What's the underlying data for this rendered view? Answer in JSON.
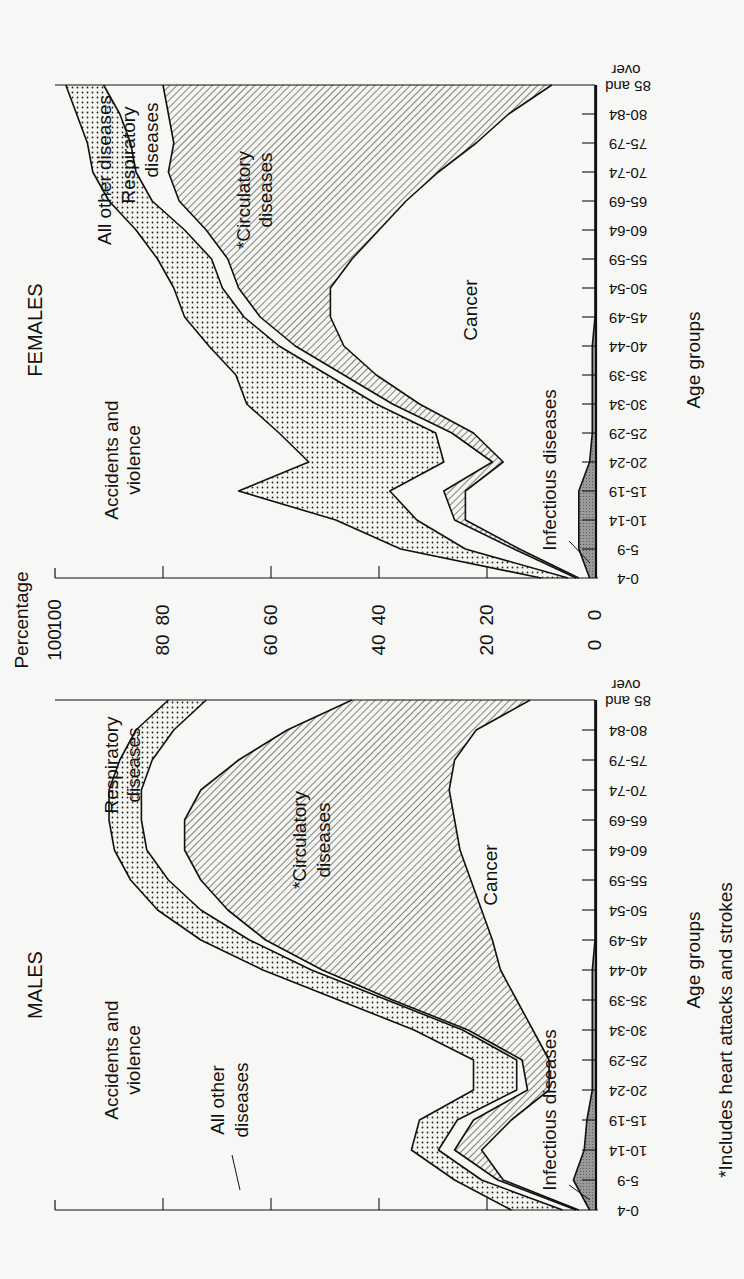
{
  "page": {
    "orientation_note": "Figure printed rotated 90 degrees; text reads bottom-to-top",
    "footnote": "*Includes heart attacks and strokes"
  },
  "chart_data": [
    {
      "type": "area",
      "stacked": true,
      "title": "FEMALES",
      "xlabel": "Age groups",
      "ylabel": "Percentage",
      "ylim": [
        0,
        100
      ],
      "yticks": [
        0,
        20,
        40,
        60,
        80,
        100
      ],
      "categories": [
        "0-4",
        "5-9",
        "10-14",
        "15-19",
        "20-24",
        "25-29",
        "30-34",
        "35-39",
        "40-44",
        "45-49",
        "50-54",
        "55-59",
        "60-64",
        "65-69",
        "70-74",
        "75-79",
        "80-84",
        "85 and over"
      ],
      "series": [
        {
          "name": "Infectious diseases",
          "pattern": "grey",
          "values": [
            1,
            3,
            3,
            3,
            1,
            0.5,
            0.5,
            0.5,
            0.5,
            0,
            0,
            0,
            0,
            0,
            0,
            0,
            0,
            0
          ]
        },
        {
          "name": "Cancer",
          "pattern": "white",
          "values": [
            2,
            11,
            21,
            21,
            16,
            22,
            32,
            40,
            46,
            49,
            49,
            45,
            40,
            35,
            29,
            22,
            16,
            8
          ]
        },
        {
          "name": "*Circulatory diseases",
          "pattern": "hatched",
          "values": [
            0.5,
            1,
            2,
            4,
            2,
            4,
            5,
            6,
            9,
            13,
            17,
            23,
            32,
            42,
            50,
            56,
            63,
            72
          ]
        },
        {
          "name": "Respiratory diseases",
          "pattern": "white",
          "values": [
            1.5,
            9,
            7,
            10,
            9,
            3,
            3,
            3,
            3,
            3,
            3,
            3,
            4,
            5,
            6,
            8,
            9,
            11
          ]
        },
        {
          "name": "All other diseases",
          "pattern": "dotted",
          "values": [
            5,
            12,
            15,
            28,
            25,
            29,
            24,
            17,
            13,
            11,
            9,
            10,
            9,
            8,
            8,
            8,
            8,
            7
          ]
        },
        {
          "name": "Accidents and violence",
          "pattern": "white",
          "values": [
            90,
            64,
            52,
            34,
            47,
            41,
            35,
            33,
            28,
            23,
            21,
            18,
            15,
            10,
            7,
            6,
            4,
            2
          ]
        }
      ],
      "labels": [
        "Accidents and violence",
        "All other diseases",
        "Respiratory diseases",
        "*Circulatory diseases",
        "Cancer",
        "Infectious diseases"
      ]
    },
    {
      "type": "area",
      "stacked": true,
      "title": "MALES",
      "xlabel": "Age groups",
      "ylabel": "Percentage",
      "ylim": [
        0,
        100
      ],
      "yticks": [
        0,
        20,
        40,
        60,
        80,
        100
      ],
      "categories": [
        "0-4",
        "5-9",
        "10-14",
        "15-19",
        "20-24",
        "25-29",
        "30-34",
        "35-39",
        "40-44",
        "45-49",
        "50-54",
        "55-59",
        "60-64",
        "65-69",
        "70-74",
        "75-79",
        "80-84",
        "85 and over"
      ],
      "series": [
        {
          "name": "Infectious diseases",
          "pattern": "grey",
          "values": [
            1,
            4,
            2,
            1.5,
            0.5,
            0.5,
            0.5,
            0.5,
            0.5,
            0,
            0,
            0,
            0,
            0,
            0,
            0,
            0,
            0
          ]
        },
        {
          "name": "Cancer",
          "pattern": "white",
          "values": [
            2,
            13,
            19,
            14,
            8,
            8,
            11,
            14,
            17,
            19,
            21,
            23,
            25,
            26,
            27,
            26,
            22,
            12
          ]
        },
        {
          "name": "*Circulatory diseases",
          "pattern": "hatched",
          "values": [
            0.5,
            1,
            5,
            7,
            4,
            5,
            12,
            23,
            33,
            42,
            47,
            50,
            51,
            50,
            46,
            40,
            35,
            33
          ]
        },
        {
          "name": "Respiratory diseases",
          "pattern": "white",
          "values": [
            2.5,
            3,
            3,
            3,
            2,
            1,
            1,
            1,
            2,
            3,
            5,
            6,
            7,
            8,
            11,
            16,
            21,
            27
          ]
        },
        {
          "name": "All other diseases",
          "pattern": "dotted",
          "values": [
            9.5,
            5,
            5,
            7,
            8,
            8,
            9,
            9,
            9,
            9,
            8,
            7,
            6,
            6,
            6,
            6,
            7,
            7
          ]
        },
        {
          "name": "Accidents and violence",
          "pattern": "white",
          "values": [
            84.5,
            74,
            66,
            67.5,
            77.5,
            77.5,
            66.5,
            52.5,
            38.5,
            27,
            19,
            14,
            11,
            10,
            10,
            12,
            15,
            21
          ]
        }
      ],
      "labels": [
        "Accidents and violence",
        "All other diseases",
        "Respiratory diseases",
        "*Circulatory diseases",
        "Cancer",
        "Infectious diseases"
      ]
    }
  ],
  "labels": {
    "females_title": "FEMALES",
    "males_title": "MALES",
    "percentage": "Percentage",
    "age_groups": "Age groups",
    "accidents": [
      "Accidents and",
      "violence"
    ],
    "all_other_f": "All other diseases",
    "all_other_m": [
      "All other",
      "diseases"
    ],
    "respiratory": [
      "Respiratory",
      "diseases"
    ],
    "circulatory": [
      "*Circulatory",
      "diseases"
    ],
    "cancer": "Cancer",
    "infectious": "Infectious diseases",
    "footnote": "*Includes heart attacks and strokes",
    "yticks": [
      "100",
      "80",
      "60",
      "40",
      "20",
      "0"
    ],
    "ages": [
      "0-4",
      "5-9",
      "10-14",
      "15-19",
      "20-24",
      "25-29",
      "30-34",
      "35-39",
      "40-44",
      "45-49",
      "50-54",
      "55-59",
      "60-64",
      "65-69",
      "70-74",
      "75-79",
      "80-84",
      "85 and",
      "over"
    ]
  }
}
